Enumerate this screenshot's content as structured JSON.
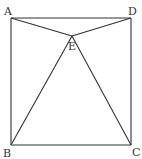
{
  "diagram": {
    "type": "geometry-figure",
    "stroke_color": "#333333",
    "background": "#ffffff",
    "points": {
      "A": {
        "label": "A",
        "x": 11,
        "y": 18,
        "label_x": 4,
        "label_y": 15
      },
      "D": {
        "label": "D",
        "x": 131,
        "y": 18,
        "label_x": 128,
        "label_y": 15
      },
      "E": {
        "label": "E",
        "x": 72,
        "y": 36,
        "label_x": 68,
        "label_y": 50
      },
      "B": {
        "label": "B",
        "x": 11,
        "y": 145,
        "label_x": 3,
        "label_y": 157
      },
      "C": {
        "label": "C",
        "x": 131,
        "y": 145,
        "label_x": 132,
        "label_y": 156
      }
    },
    "segments": [
      [
        "A",
        "D"
      ],
      [
        "D",
        "C"
      ],
      [
        "C",
        "B"
      ],
      [
        "B",
        "A"
      ],
      [
        "A",
        "E"
      ],
      [
        "D",
        "E"
      ],
      [
        "B",
        "E"
      ],
      [
        "C",
        "E"
      ]
    ]
  }
}
